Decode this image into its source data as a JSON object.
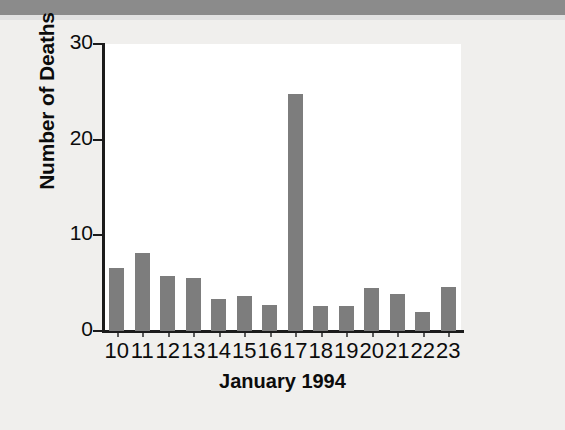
{
  "chart_data": {
    "type": "bar",
    "title": "",
    "subtitle": "",
    "xlabel": "January 1994",
    "ylabel": "Number of Deaths",
    "categories": [
      "10",
      "11",
      "12",
      "13",
      "14",
      "15",
      "16",
      "17",
      "18",
      "19",
      "20",
      "21",
      "22",
      "23"
    ],
    "values": [
      6.6,
      8.2,
      5.7,
      5.5,
      3.3,
      3.7,
      2.7,
      24.8,
      2.6,
      2.6,
      4.5,
      3.9,
      2.0,
      4.6
    ],
    "series": [
      {
        "name": "Number of Deaths",
        "values": [
          6.6,
          8.2,
          5.7,
          5.5,
          3.3,
          3.7,
          2.7,
          24.8,
          2.6,
          2.6,
          4.5,
          3.9,
          2.0,
          4.6
        ]
      }
    ],
    "ylim": [
      0,
      30
    ],
    "yticks": [
      0,
      10,
      20,
      30
    ],
    "ytick_labels": [
      "0",
      "10",
      "20",
      "30"
    ],
    "xtick_labels": [
      "10",
      "11",
      "12",
      "13",
      "14",
      "15",
      "16",
      "17",
      "18",
      "19",
      "20",
      "21",
      "22",
      "23"
    ],
    "grid": false,
    "legend": false,
    "legend_position": "none",
    "bar_color": "#7d7d7d",
    "axis_color": "#1b1b1b",
    "plot_background": "#ffffff",
    "figure_background": "#f0efed",
    "scan_band_color": "#8b8b8b",
    "annotations": []
  }
}
